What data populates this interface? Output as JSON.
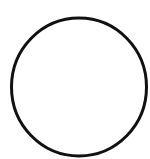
{
  "shape": {
    "type": "circle",
    "cx": 79,
    "cy": 87,
    "rx": 67.5,
    "ry": 69,
    "stroke": "#111111",
    "stroke_width": 3,
    "fill": "#ffffff"
  },
  "background": "#ffffff"
}
